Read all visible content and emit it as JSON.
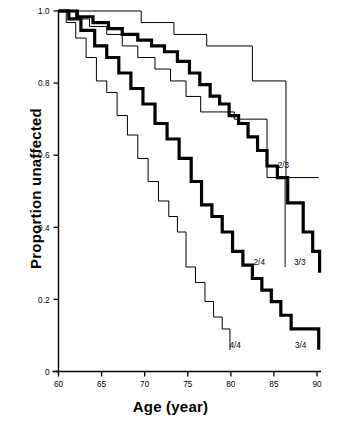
{
  "chart_data": {
    "type": "line",
    "subtype": "kaplan-meier-step",
    "title": "",
    "xlabel": "Age (year)",
    "ylabel": "Proportion unaffected",
    "xlim": [
      60,
      90
    ],
    "ylim": [
      0,
      1.0
    ],
    "xticks": [
      60,
      65,
      70,
      75,
      80,
      85,
      90
    ],
    "xticklabels": [
      "60",
      "65",
      "70",
      "75",
      "80",
      "85",
      "90"
    ],
    "yticks": [
      0,
      0.2,
      0.4,
      0.6,
      0.8,
      1.0
    ],
    "yticklabels": [
      "0",
      "0.2",
      "0.4",
      "0.6",
      "0.8",
      "1.0"
    ],
    "grid": false,
    "legend": "inline-end-labels",
    "series": [
      {
        "name": "2/3",
        "label": "2/3",
        "style": "thin",
        "color": "#000000",
        "linewidth": 1,
        "label_x": 86.1,
        "label_y": 0.565,
        "points": [
          [
            60.0,
            1.0
          ],
          [
            69.6,
            1.0
          ],
          [
            69.6,
            0.968
          ],
          [
            73.4,
            0.968
          ],
          [
            73.4,
            0.935
          ],
          [
            77.2,
            0.935
          ],
          [
            77.2,
            0.903
          ],
          [
            82.5,
            0.903
          ],
          [
            82.5,
            0.806
          ],
          [
            86.4,
            0.806
          ],
          [
            86.4,
            0.538
          ],
          [
            90.2,
            0.538
          ]
        ]
      },
      {
        "name": "2/4",
        "label": "2/4",
        "style": "thin",
        "color": "#000000",
        "linewidth": 1,
        "label_x": 83.3,
        "label_y": 0.295,
        "points": [
          [
            60.0,
            1.0
          ],
          [
            62.0,
            1.0
          ],
          [
            62.0,
            0.978
          ],
          [
            63.6,
            0.978
          ],
          [
            63.6,
            0.957
          ],
          [
            65.6,
            0.957
          ],
          [
            65.6,
            0.935
          ],
          [
            67.4,
            0.935
          ],
          [
            67.4,
            0.903
          ],
          [
            69.2,
            0.903
          ],
          [
            69.2,
            0.871
          ],
          [
            71.2,
            0.871
          ],
          [
            71.2,
            0.839
          ],
          [
            73.0,
            0.839
          ],
          [
            73.0,
            0.806
          ],
          [
            74.8,
            0.806
          ],
          [
            74.8,
            0.763
          ],
          [
            76.5,
            0.763
          ],
          [
            76.5,
            0.72
          ],
          [
            80.4,
            0.72
          ],
          [
            80.4,
            0.7
          ],
          [
            84.2,
            0.7
          ],
          [
            84.2,
            0.538
          ],
          [
            86.3,
            0.538
          ],
          [
            86.3,
            0.29
          ]
        ]
      },
      {
        "name": "3/3",
        "label": "3/3",
        "style": "bold",
        "color": "#000000",
        "linewidth": 3.2,
        "label_x": 88.0,
        "label_y": 0.295,
        "points": [
          [
            60.0,
            1.0
          ],
          [
            62.2,
            1.0
          ],
          [
            62.2,
            0.984
          ],
          [
            64.0,
            0.984
          ],
          [
            64.0,
            0.968
          ],
          [
            65.8,
            0.968
          ],
          [
            65.8,
            0.951
          ],
          [
            67.4,
            0.951
          ],
          [
            67.4,
            0.935
          ],
          [
            69.2,
            0.935
          ],
          [
            69.2,
            0.919
          ],
          [
            70.8,
            0.919
          ],
          [
            70.8,
            0.903
          ],
          [
            72.3,
            0.903
          ],
          [
            72.3,
            0.887
          ],
          [
            73.8,
            0.887
          ],
          [
            73.8,
            0.86
          ],
          [
            75.2,
            0.86
          ],
          [
            75.2,
            0.828
          ],
          [
            76.4,
            0.828
          ],
          [
            76.4,
            0.796
          ],
          [
            77.6,
            0.796
          ],
          [
            77.6,
            0.764
          ],
          [
            78.7,
            0.764
          ],
          [
            78.7,
            0.742
          ],
          [
            79.8,
            0.742
          ],
          [
            79.8,
            0.71
          ],
          [
            80.9,
            0.71
          ],
          [
            80.9,
            0.688
          ],
          [
            82.0,
            0.688
          ],
          [
            82.0,
            0.651
          ],
          [
            83.1,
            0.651
          ],
          [
            83.1,
            0.613
          ],
          [
            84.2,
            0.613
          ],
          [
            84.2,
            0.57
          ],
          [
            85.4,
            0.57
          ],
          [
            85.4,
            0.538
          ],
          [
            86.6,
            0.538
          ],
          [
            86.6,
            0.468
          ],
          [
            88.4,
            0.468
          ],
          [
            88.4,
            0.387
          ],
          [
            89.5,
            0.387
          ],
          [
            89.5,
            0.333
          ],
          [
            90.3,
            0.333
          ],
          [
            90.3,
            0.274
          ]
        ]
      },
      {
        "name": "3/4",
        "label": "3/4",
        "style": "bold",
        "color": "#000000",
        "linewidth": 3.2,
        "label_x": 88.1,
        "label_y": 0.065,
        "points": [
          [
            60.0,
            1.0
          ],
          [
            61.2,
            1.0
          ],
          [
            61.2,
            0.978
          ],
          [
            62.6,
            0.978
          ],
          [
            62.6,
            0.946
          ],
          [
            64.2,
            0.946
          ],
          [
            64.2,
            0.903
          ],
          [
            65.6,
            0.903
          ],
          [
            65.6,
            0.871
          ],
          [
            67.0,
            0.871
          ],
          [
            67.0,
            0.828
          ],
          [
            68.4,
            0.828
          ],
          [
            68.4,
            0.785
          ],
          [
            69.8,
            0.785
          ],
          [
            69.8,
            0.742
          ],
          [
            71.2,
            0.742
          ],
          [
            71.2,
            0.688
          ],
          [
            72.6,
            0.688
          ],
          [
            72.6,
            0.645
          ],
          [
            74.0,
            0.645
          ],
          [
            74.0,
            0.591
          ],
          [
            75.4,
            0.591
          ],
          [
            75.4,
            0.527
          ],
          [
            76.6,
            0.527
          ],
          [
            76.6,
            0.462
          ],
          [
            77.8,
            0.462
          ],
          [
            77.8,
            0.43
          ],
          [
            79.0,
            0.43
          ],
          [
            79.0,
            0.387
          ],
          [
            80.2,
            0.387
          ],
          [
            80.2,
            0.333
          ],
          [
            81.4,
            0.333
          ],
          [
            81.4,
            0.295
          ],
          [
            82.5,
            0.295
          ],
          [
            82.5,
            0.258
          ],
          [
            83.6,
            0.258
          ],
          [
            83.6,
            0.226
          ],
          [
            84.7,
            0.226
          ],
          [
            84.7,
            0.194
          ],
          [
            85.8,
            0.194
          ],
          [
            85.8,
            0.156
          ],
          [
            87.0,
            0.156
          ],
          [
            87.0,
            0.118
          ],
          [
            90.2,
            0.118
          ],
          [
            90.2,
            0.06
          ]
        ]
      },
      {
        "name": "4/4",
        "label": "4/4",
        "style": "thin",
        "color": "#000000",
        "linewidth": 1,
        "label_x": 80.5,
        "label_y": 0.065,
        "points": [
          [
            60.0,
            1.0
          ],
          [
            60.9,
            1.0
          ],
          [
            60.9,
            0.968
          ],
          [
            62.0,
            0.968
          ],
          [
            62.0,
            0.925
          ],
          [
            63.2,
            0.925
          ],
          [
            63.2,
            0.871
          ],
          [
            64.4,
            0.871
          ],
          [
            64.4,
            0.806
          ],
          [
            65.6,
            0.806
          ],
          [
            65.6,
            0.774
          ],
          [
            66.8,
            0.774
          ],
          [
            66.8,
            0.71
          ],
          [
            68.0,
            0.71
          ],
          [
            68.0,
            0.656
          ],
          [
            69.2,
            0.656
          ],
          [
            69.2,
            0.591
          ],
          [
            70.4,
            0.591
          ],
          [
            70.4,
            0.527
          ],
          [
            71.6,
            0.527
          ],
          [
            71.6,
            0.473
          ],
          [
            72.8,
            0.473
          ],
          [
            72.8,
            0.43
          ],
          [
            73.8,
            0.43
          ],
          [
            73.8,
            0.387
          ],
          [
            74.8,
            0.387
          ],
          [
            74.8,
            0.29
          ],
          [
            75.9,
            0.29
          ],
          [
            75.9,
            0.247
          ],
          [
            77.0,
            0.247
          ],
          [
            77.0,
            0.194
          ],
          [
            78.0,
            0.194
          ],
          [
            78.0,
            0.151
          ],
          [
            79.0,
            0.151
          ],
          [
            79.0,
            0.118
          ],
          [
            79.9,
            0.118
          ],
          [
            79.9,
            0.06
          ]
        ]
      }
    ],
    "point_labels": [
      {
        "text": "2/3",
        "x": 86.1,
        "y": 0.565
      },
      {
        "text": "2/4",
        "x": 83.3,
        "y": 0.295
      },
      {
        "text": "3/3",
        "x": 88.0,
        "y": 0.295
      },
      {
        "text": "4/4",
        "x": 80.5,
        "y": 0.065
      },
      {
        "text": "3/4",
        "x": 88.1,
        "y": 0.065
      }
    ],
    "axis_color": "#000000",
    "background_color": "#ffffff"
  }
}
